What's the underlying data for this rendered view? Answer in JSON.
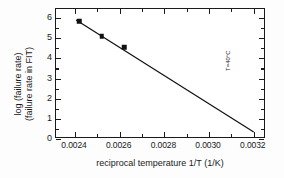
{
  "chart_data": {
    "type": "scatter",
    "title": "",
    "subtitle": "",
    "xlabel": "reciprocal temperature 1/T (1/K)",
    "ylabel_line1": "log (failure rate)",
    "ylabel_line2": "(failure rate in FIT)",
    "xlim": [
      0.002315,
      0.003255
    ],
    "ylim": [
      0.0,
      6.45
    ],
    "grid": false,
    "legend": null,
    "xticks": [
      0.0024,
      0.0026,
      0.0028,
      0.003,
      0.0032
    ],
    "xticklabels": [
      "0.0024",
      "0.0026",
      "0.0028",
      "0.0030",
      "0.0032"
    ],
    "xminorticks": [
      0.0025,
      0.0027,
      0.0029,
      0.0031
    ],
    "yticks": [
      0,
      1,
      2,
      3,
      4,
      5,
      6
    ],
    "yticklabels": [
      "0",
      "1",
      "2",
      "3",
      "4",
      "5",
      "6"
    ],
    "yminorticks": [
      0.5,
      1.5,
      2.5,
      3.5,
      4.5,
      5.5
    ],
    "series": [
      {
        "name": "measured failure rate",
        "type": "scatter",
        "marker": "square",
        "color": "#111111",
        "x": [
          0.00242,
          0.00252,
          0.00262
        ],
        "y": [
          5.85,
          5.1,
          4.55
        ]
      },
      {
        "name": "Arrhenius fit",
        "type": "line",
        "color": "#111111",
        "x": [
          0.002405,
          0.0032
        ],
        "y": [
          5.9,
          0.35
        ]
      }
    ],
    "annotations": [
      {
        "text": "T=40°C",
        "x": 0.003075,
        "y": 3.3,
        "rotation": 90
      }
    ]
  }
}
